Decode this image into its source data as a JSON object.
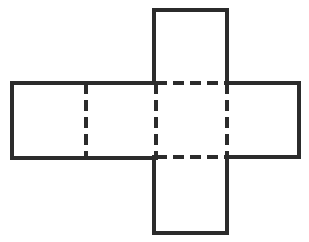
{
  "figure": {
    "kind": "geometric-net",
    "background_color": "#ffffff",
    "line_color": "#2b2b2b",
    "solid_line_width": 4,
    "dashed_line_width": 4,
    "dash_pattern": "11 6",
    "canvas": {
      "width": 309,
      "height": 242
    }
  },
  "geometry": {
    "center_face": {
      "x1": 156,
      "y1": 83,
      "x2": 227,
      "y2": 157
    },
    "top_flap": {
      "x1": 154,
      "y1": 10,
      "x2": 227,
      "y2": 83
    },
    "bottom_flap": {
      "x1": 154,
      "y1": 157,
      "x2": 227,
      "y2": 233
    },
    "left_wing": {
      "x1": 12,
      "y1": 83,
      "x2": 156,
      "y2": 158
    },
    "right_wing": {
      "x1": 227,
      "y1": 83,
      "x2": 299,
      "y2": 157
    },
    "interior_fold_x": 86
  },
  "solid_edges": [
    {
      "name": "top-flap-left-edge",
      "x1": 154,
      "y1": 10,
      "x2": 154,
      "y2": 83
    },
    {
      "name": "top-flap-top-edge",
      "x1": 154,
      "y1": 10,
      "x2": 227,
      "y2": 10
    },
    {
      "name": "top-flap-right-edge",
      "x1": 227,
      "y1": 10,
      "x2": 227,
      "y2": 83
    },
    {
      "name": "left-wing-top-edge",
      "x1": 12,
      "y1": 83,
      "x2": 156,
      "y2": 83
    },
    {
      "name": "left-wing-left-edge",
      "x1": 12,
      "y1": 83,
      "x2": 12,
      "y2": 158
    },
    {
      "name": "left-wing-bottom-edge",
      "x1": 12,
      "y1": 158,
      "x2": 156,
      "y2": 158
    },
    {
      "name": "right-wing-top-edge",
      "x1": 227,
      "y1": 83,
      "x2": 299,
      "y2": 83
    },
    {
      "name": "right-wing-right-edge",
      "x1": 299,
      "y1": 83,
      "x2": 299,
      "y2": 157
    },
    {
      "name": "right-wing-bottom-edge",
      "x1": 227,
      "y1": 157,
      "x2": 299,
      "y2": 157
    },
    {
      "name": "bottom-flap-left-edge",
      "x1": 154,
      "y1": 157,
      "x2": 154,
      "y2": 233
    },
    {
      "name": "bottom-flap-bottom-edge",
      "x1": 154,
      "y1": 233,
      "x2": 227,
      "y2": 233
    },
    {
      "name": "bottom-flap-right-edge",
      "x1": 227,
      "y1": 157,
      "x2": 227,
      "y2": 233
    }
  ],
  "dashed_fold_lines": [
    {
      "name": "fold-top-horizontal",
      "x1": 156,
      "y1": 83,
      "x2": 227,
      "y2": 83
    },
    {
      "name": "fold-bottom-horizontal",
      "x1": 156,
      "y1": 157,
      "x2": 227,
      "y2": 157
    },
    {
      "name": "fold-center-left",
      "x1": 156,
      "y1": 83,
      "x2": 156,
      "y2": 157
    },
    {
      "name": "fold-center-right",
      "x1": 227,
      "y1": 83,
      "x2": 227,
      "y2": 157
    },
    {
      "name": "fold-left-wing-inner",
      "x1": 86,
      "y1": 83,
      "x2": 86,
      "y2": 158
    }
  ],
  "labels": {
    "none_visible": ""
  }
}
